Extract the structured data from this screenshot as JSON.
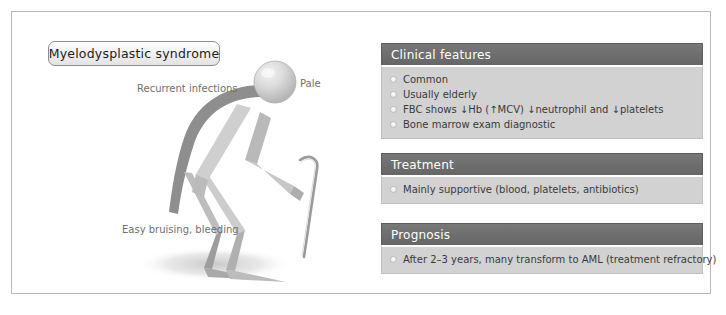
{
  "title": {
    "label": "Myelodysplastic syndrome"
  },
  "figure": {
    "labels": {
      "recurrent_infections": "Recurrent infections",
      "pale": "Pale",
      "easy_bruising": "Easy bruising, bleeding"
    },
    "icons": {
      "head": "head-sphere-icon",
      "body": "hunched-stick-figure-icon",
      "cane": "walking-cane-icon",
      "shadow": "floor-shadow-icon"
    }
  },
  "panels": [
    {
      "id": "clinical",
      "header": "Clinical features",
      "items": [
        "Common",
        "Usually elderly",
        "FBC shows ↓Hb (↑MCV) ↓neutrophil and ↓platelets",
        "Bone marrow exam diagnostic"
      ]
    },
    {
      "id": "treatment",
      "header": "Treatment",
      "items": [
        "Mainly supportive (blood, platelets, antibiotics)"
      ]
    },
    {
      "id": "prognosis",
      "header": "Prognosis",
      "items": [
        "After 2–3 years, many transform to AML (treatment refractory)"
      ]
    }
  ],
  "colors": {
    "panel_header_bg": "#6e6e6e",
    "panel_body_bg": "#d2d2d2",
    "frame_border": "#b9b9b9",
    "label_text": "#6f6f6f",
    "figure_dark": "#8f8f8f",
    "figure_light": "#c9c9c9"
  }
}
